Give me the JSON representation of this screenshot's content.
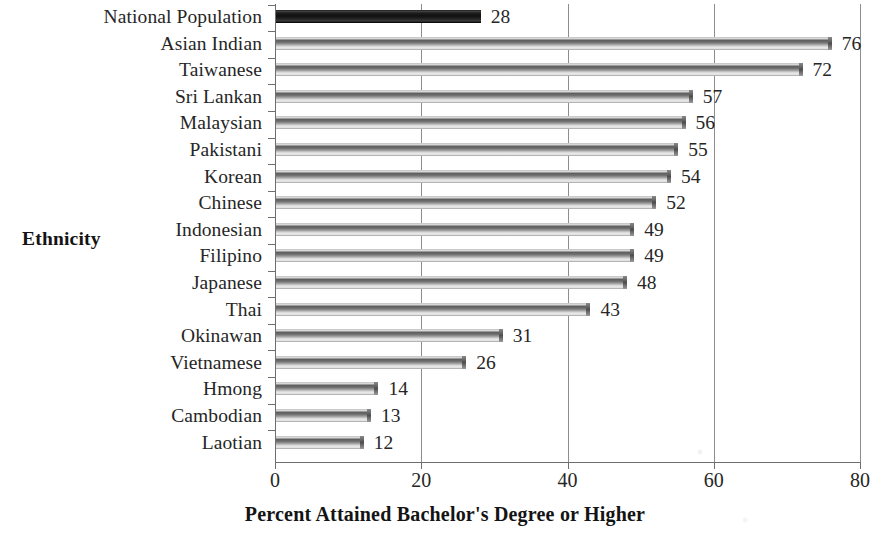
{
  "chart_data": {
    "type": "bar",
    "orientation": "horizontal",
    "title": "",
    "xlabel": "Percent Attained Bachelor's Degree or Higher",
    "ylabel": "Ethnicity",
    "xlim": [
      0,
      80
    ],
    "xticks": [
      "0",
      "20",
      "40",
      "60",
      "80"
    ],
    "grid": true,
    "legend": "none",
    "highlight_category": "National Population",
    "categories": [
      "National Population",
      "Asian Indian",
      "Taiwanese",
      "Sri Lankan",
      "Malaysian",
      "Pakistani",
      "Korean",
      "Chinese",
      "Indonesian",
      "Filipino",
      "Japanese",
      "Thai",
      "Okinawan",
      "Vietnamese",
      "Hmong",
      "Cambodian",
      "Laotian"
    ],
    "values": [
      28,
      76,
      72,
      57,
      56,
      55,
      54,
      52,
      49,
      49,
      48,
      43,
      31,
      26,
      14,
      13,
      12
    ],
    "data_labels": [
      "28",
      "76",
      "72",
      "57",
      "56",
      "55",
      "54",
      "52",
      "49",
      "49",
      "48",
      "43",
      "31",
      "26",
      "14",
      "13",
      "12"
    ],
    "colors": {
      "highlight_bar": "#1d1d1d",
      "bar": "#707070",
      "gridline": "#8d8d8d",
      "axis": "#6e6e6e",
      "text": "#262626",
      "background": "#ffffff"
    }
  }
}
